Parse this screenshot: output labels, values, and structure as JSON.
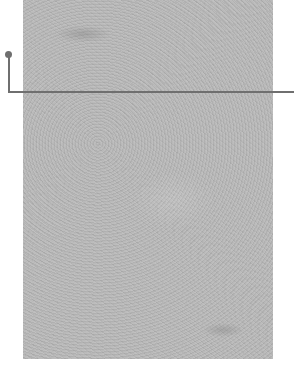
{
  "image": {
    "description": "textured gray paper panel with callout leader line",
    "panel_color": "#b9b9b9",
    "leader_color": "#6f6f6f"
  }
}
